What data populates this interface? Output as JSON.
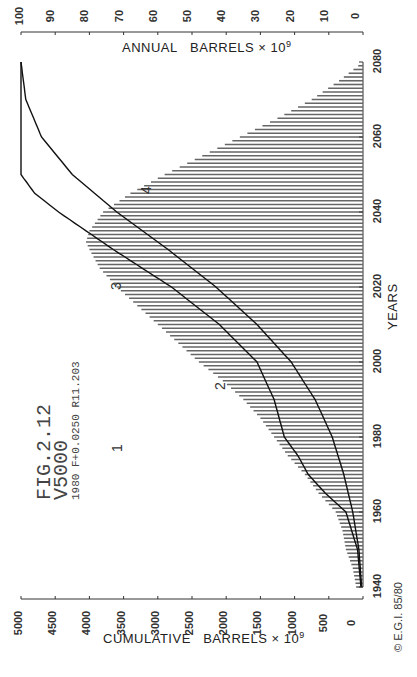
{
  "chart_data": {
    "type": "bar",
    "orientation": "rotated 90 degrees clockwise (years run bottom-to-top along right edge, values run right-to-left)",
    "title": "FIG.2.12",
    "annotations": {
      "fig_label": "FIG.2.12",
      "scenario": "V5000",
      "params": "1980 F+0.0250 R11.203",
      "copyright": "© E.G.I. 85/80",
      "curve_labels": [
        "1",
        "2",
        "3",
        "4"
      ]
    },
    "xlabel": "YEARS",
    "x_ticks": [
      1940,
      1960,
      1980,
      2000,
      2020,
      2040,
      2060,
      2080
    ],
    "xlim": [
      1940,
      2080
    ],
    "y_left_label": "CUMULATIVE BARRELS × 10^9",
    "y_left_ticks": [
      0,
      500,
      1000,
      1500,
      2000,
      2500,
      3000,
      3500,
      4000,
      4500,
      5000
    ],
    "y_left_lim": [
      0,
      5000
    ],
    "y_right_label": "ANNUAL BARRELS × 10^9",
    "y_right_ticks": [
      0,
      10,
      20,
      30,
      40,
      50,
      60,
      70,
      80,
      90,
      100
    ],
    "y_right_lim": [
      0,
      100
    ],
    "grid": false,
    "series": [
      {
        "name": "Annual production (hatched bars)",
        "axis": "annual",
        "x": [
          1940,
          1945,
          1950,
          1955,
          1960,
          1965,
          1970,
          1975,
          1980,
          1985,
          1990,
          1995,
          2000,
          2005,
          2010,
          2015,
          2020,
          2025,
          2030,
          2032,
          2035,
          2040,
          2045,
          2050,
          2055,
          2060,
          2065,
          2070,
          2075,
          2080
        ],
        "values": [
          2,
          3,
          5,
          6,
          8,
          13,
          17,
          22,
          26,
          30,
          35,
          41,
          48,
          54,
          60,
          66,
          72,
          77,
          80,
          81,
          80,
          76,
          68,
          58,
          47,
          36,
          25,
          15,
          7,
          0
        ]
      },
      {
        "name": "Cumulative production (reaches 5000 cap ~2050)",
        "axis": "cumulative",
        "x": [
          1940,
          1950,
          1960,
          1965,
          1970,
          1975,
          1980,
          1990,
          2000,
          2010,
          2020,
          2030,
          2040,
          2045,
          2050,
          2060,
          2080
        ],
        "values": [
          30,
          80,
          250,
          550,
          800,
          950,
          1150,
          1300,
          1550,
          2100,
          2800,
          3650,
          4450,
          4800,
          5000,
          5000,
          5000
        ]
      },
      {
        "name": "Cumulative (asymptotic curve)",
        "axis": "cumulative",
        "x": [
          1940,
          1950,
          1960,
          1970,
          1980,
          1990,
          2000,
          2010,
          2020,
          2030,
          2040,
          2050,
          2060,
          2070,
          2080
        ],
        "values": [
          20,
          60,
          150,
          280,
          450,
          700,
          1050,
          1550,
          2150,
          2850,
          3600,
          4250,
          4700,
          4930,
          5000
        ]
      }
    ]
  }
}
